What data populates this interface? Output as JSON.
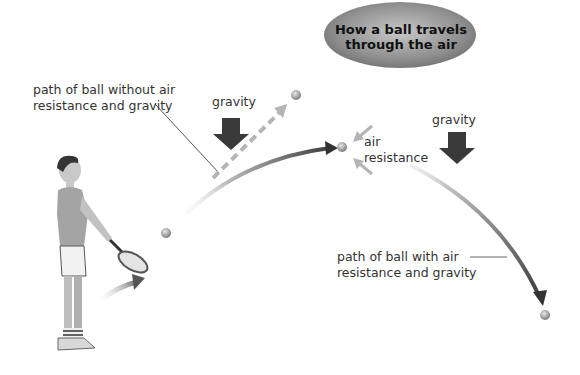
{
  "diagram": {
    "title": "How a ball travels through the air",
    "title_lines": [
      "How a ball travels",
      "through the air"
    ],
    "labels": {
      "no_air_path": [
        "path of ball without air",
        "resistance and gravity"
      ],
      "gravity_left": "gravity",
      "gravity_right": "gravity",
      "air_resistance": [
        "air",
        "resistance"
      ],
      "with_air_path": [
        "path of ball with air",
        "resistance and gravity"
      ]
    },
    "elements": {
      "figure": "tennis player with racket",
      "balls": 4
    },
    "colors": {
      "title_ellipse": "#8a8a8a",
      "arrow_dark": "#3a3a3a",
      "arrow_light": "#b5b5b5",
      "ball": "#a8a8a8",
      "text": "#333333"
    }
  }
}
